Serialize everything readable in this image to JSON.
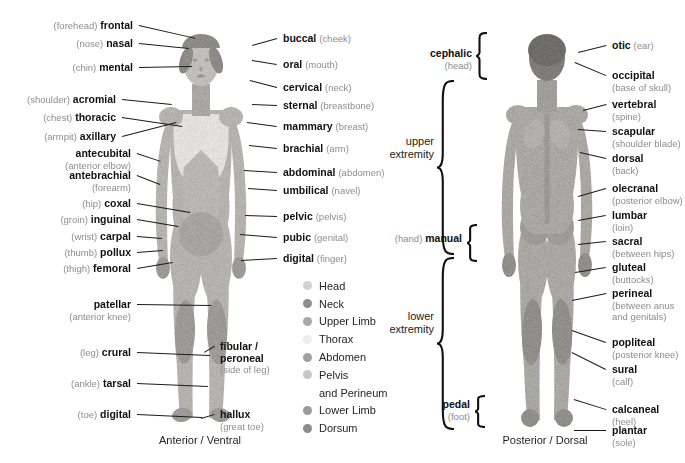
{
  "diagram": {
    "captions": {
      "anterior": "Anterior / Ventral",
      "posterior": "Posterior / Dorsal"
    }
  },
  "anterior_left_labels": [
    {
      "plain": "(forehead)",
      "term": "frontal",
      "plain_after": ""
    },
    {
      "plain": "(nose)",
      "term": "nasal",
      "plain_after": ""
    },
    {
      "plain": "(chin)",
      "term": "mental",
      "plain_after": ""
    },
    {
      "plain": "(shoulder)",
      "term": "acromial",
      "plain_after": ""
    },
    {
      "plain": "(chest)",
      "term": "thoracic",
      "plain_after": ""
    },
    {
      "plain": "(armpit)",
      "term": "axillary",
      "plain_after": ""
    },
    {
      "plain": "",
      "term": "antecubital",
      "plain_after": "(anterior elbow)"
    },
    {
      "plain": "",
      "term": "antebrachial",
      "plain_after": "(forearm)"
    },
    {
      "plain": "(hip)",
      "term": "coxal",
      "plain_after": ""
    },
    {
      "plain": "(groin)",
      "term": "inguinal",
      "plain_after": ""
    },
    {
      "plain": "(wrist)",
      "term": "carpal",
      "plain_after": ""
    },
    {
      "plain": "(thumb)",
      "term": "pollux",
      "plain_after": ""
    },
    {
      "plain": "(thigh)",
      "term": "femoral",
      "plain_after": ""
    },
    {
      "plain": "",
      "term": "patellar",
      "plain_after": "(anterior knee)"
    },
    {
      "plain": "(leg)",
      "term": "crural",
      "plain_after": ""
    },
    {
      "plain": "(ankle)",
      "term": "tarsal",
      "plain_after": ""
    },
    {
      "plain": "(toe)",
      "term": "digital",
      "plain_after": ""
    }
  ],
  "anterior_right_labels": [
    {
      "term": "buccal",
      "plain": "(cheek)"
    },
    {
      "term": "oral",
      "plain": "(mouth)"
    },
    {
      "term": "cervical",
      "plain": "(neck)"
    },
    {
      "term": "sternal",
      "plain": "(breastbone)"
    },
    {
      "term": "mammary",
      "plain": "(breast)"
    },
    {
      "term": "brachial",
      "plain": "(arm)"
    },
    {
      "term": "abdominal",
      "plain": "(abdomen)"
    },
    {
      "term": "umbilical",
      "plain": "(navel)"
    },
    {
      "term": "pelvic",
      "plain": "(pelvis)"
    },
    {
      "term": "pubic",
      "plain": "(genital)"
    },
    {
      "term": "digital",
      "plain": "(finger)"
    },
    {
      "term": "fibular / peroneal",
      "plain": "(side of leg)"
    },
    {
      "term": "hallux",
      "plain": "(great toe)"
    }
  ],
  "posterior_right_labels": [
    {
      "term": "otic",
      "plain": "(ear)"
    },
    {
      "term": "occipital",
      "plain": "(base of skull)"
    },
    {
      "term": "vertebral",
      "plain": "(spine)"
    },
    {
      "term": "scapular",
      "plain": "(shoulder blade)"
    },
    {
      "term": "dorsal",
      "plain": "(back)"
    },
    {
      "term": "olecranal",
      "plain": "(posterior elbow)"
    },
    {
      "term": "lumbar",
      "plain": "(loin)"
    },
    {
      "term": "sacral",
      "plain": "(between hips)"
    },
    {
      "term": "gluteal",
      "plain": "(buttocks)"
    },
    {
      "term": "perineal",
      "plain": "(between anus and genitals)"
    },
    {
      "term": "popliteal",
      "plain": "(posterior knee)"
    },
    {
      "term": "sural",
      "plain": "(calf)"
    },
    {
      "term": "calcaneal",
      "plain": "(heel)"
    },
    {
      "term": "plantar",
      "plain": "(sole)"
    }
  ],
  "posterior_left_labels": [
    {
      "term": "cephalic",
      "plain": "(head)",
      "prefix": ""
    },
    {
      "term": "manual",
      "plain": "",
      "prefix": "(hand)"
    },
    {
      "term": "pedal",
      "plain": "(foot)",
      "prefix": ""
    }
  ],
  "brackets": [
    {
      "line1": "upper",
      "line2": "extremity"
    },
    {
      "line1": "lower",
      "line2": "extremity"
    }
  ],
  "legend": {
    "items": [
      {
        "label": "Head",
        "color": "#d2d2d2",
        "continuation": ""
      },
      {
        "label": "Neck",
        "color": "#8e8e8e",
        "continuation": ""
      },
      {
        "label": "Upper Limb",
        "color": "#a8a8a8",
        "continuation": ""
      },
      {
        "label": "Thorax",
        "color": "#ececec",
        "continuation": ""
      },
      {
        "label": "Abdomen",
        "color": "#a0a0a0",
        "continuation": ""
      },
      {
        "label": "Pelvis",
        "color": "#c6c6c6",
        "continuation": "and Perineum"
      },
      {
        "label": "Lower Limb",
        "color": "#9a9a9a",
        "continuation": ""
      },
      {
        "label": "Dorsum",
        "color": "#8c8c8c",
        "continuation": ""
      }
    ]
  }
}
